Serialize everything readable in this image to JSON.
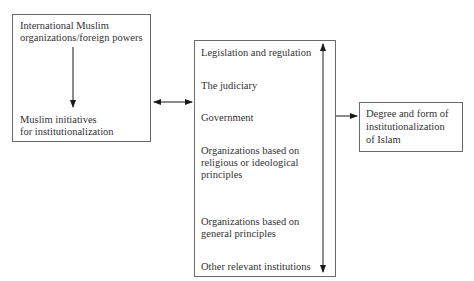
{
  "diagram": {
    "left_box": {
      "top_label": [
        "International Muslim",
        "organizations/foreign powers"
      ],
      "bottom_label": [
        "Muslim initiatives",
        "for institutionalization"
      ]
    },
    "middle_box": {
      "items": [
        [
          "Legislation and regulation"
        ],
        [
          "The judiciary"
        ],
        [
          "Government"
        ],
        [
          "Organizations based on",
          "religious or ideological",
          "principles"
        ],
        [
          "Organizations based on",
          "general principles"
        ],
        [
          "Other relevant institutions"
        ]
      ]
    },
    "right_box": {
      "label": [
        "Degree and form of",
        "institutionalization",
        "of Islam"
      ]
    },
    "connectors": [
      {
        "from": "left_box.top_label",
        "to": "left_box.bottom_label",
        "type": "single-arrow-down"
      },
      {
        "from": "left_box",
        "to": "middle_box",
        "type": "double-arrow-horizontal"
      },
      {
        "from": "middle_box.items.0",
        "to": "middle_box.items.5",
        "type": "double-arrow-vertical"
      },
      {
        "from": "middle_box",
        "to": "right_box",
        "type": "single-arrow-right"
      }
    ],
    "colors": {
      "line": "#1a1a1a",
      "border": "#6a6a6a",
      "text": "#333333"
    }
  }
}
